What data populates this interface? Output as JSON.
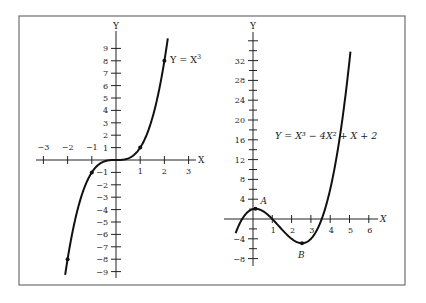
{
  "figure": {
    "frame": {
      "x": 19,
      "y": 16,
      "width": 386,
      "height": 269,
      "color": "#6e6e6e"
    },
    "ink_color": "#111111"
  },
  "chart_data": [
    {
      "type": "line",
      "title": "Y = X^3",
      "equation_label": "Y = X",
      "equation_exponent": "3",
      "xlabel": "X",
      "ylabel": "Y",
      "xlim": [
        -3.3,
        3.3
      ],
      "ylim": [
        -9.6,
        9.9
      ],
      "x_ticks": [
        -3,
        -2,
        -1,
        1,
        2,
        3
      ],
      "x_tick_labels": [
        "−3",
        "−2",
        "−1",
        "1",
        "2",
        "3"
      ],
      "y_ticks": [
        9,
        8,
        7,
        6,
        5,
        4,
        3,
        2,
        1,
        -1,
        -2,
        -3,
        -4,
        -5,
        -6,
        -7,
        -8,
        -9
      ],
      "y_tick_labels": [
        "9",
        "8",
        "7",
        "6",
        "5",
        "4",
        "3",
        "2",
        "1",
        "−1",
        "−2",
        "−3",
        "−4",
        "−5",
        "−6",
        "−7",
        "−8",
        "−9"
      ],
      "marked_points": [
        {
          "x": -2,
          "y": -8
        },
        {
          "x": -1,
          "y": -1
        },
        {
          "x": 1,
          "y": 1
        },
        {
          "x": 2,
          "y": 8
        }
      ],
      "curve_x_range": [
        -2.1,
        2.14
      ],
      "grid": false
    },
    {
      "type": "line",
      "title": "Y = X^3 - 4X^2 + X + 2",
      "equation_label": "Y = X³ − 4X² + X + 2",
      "xlabel": "X",
      "ylabel": "Y",
      "xlim": [
        -1.2,
        6.6
      ],
      "ylim": [
        -10,
        37
      ],
      "x_ticks": [
        1,
        2,
        3,
        4,
        5,
        6
      ],
      "x_tick_labels": [
        "1",
        "2",
        "3",
        "4",
        "5",
        "6"
      ],
      "y_ticks_major": [
        32,
        28,
        24,
        20,
        16,
        12,
        8,
        4,
        -4,
        -8
      ],
      "y_tick_labels": [
        "32",
        "28",
        "24",
        "20",
        "16",
        "12",
        "8",
        "4",
        "−4",
        "−8"
      ],
      "y_ticks_minor_step": 2,
      "marked_points": [
        {
          "label": "A",
          "x": 0.13,
          "y": 2.06,
          "kind": "local maximum"
        },
        {
          "label": "B",
          "x": 2.54,
          "y": -4.88,
          "kind": "local minimum"
        }
      ],
      "curve_x_range": [
        -0.9,
        5.05
      ],
      "grid": false
    }
  ]
}
